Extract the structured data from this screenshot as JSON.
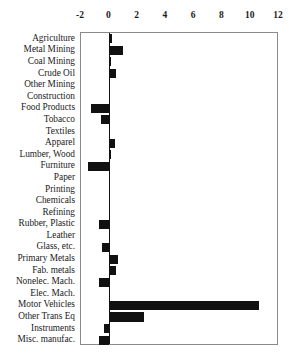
{
  "chart_data": {
    "type": "bar",
    "orientation": "horizontal",
    "title": "",
    "subtitle": "",
    "xlabel": "",
    "ylabel": "",
    "xlim": [
      -2,
      12
    ],
    "xticks": [
      -2,
      0,
      2,
      4,
      6,
      8,
      10,
      12
    ],
    "xticklabels": [
      "-2",
      "0",
      "2",
      "4",
      "6",
      "8",
      "10",
      "12"
    ],
    "grid": false,
    "legend": false,
    "legend_position": "none",
    "bar_color": "#111111",
    "frame_color": "#8a8a8a",
    "categories": [
      "Agriculture",
      "Metal Mining",
      "Coal Mining",
      "Crude Oil",
      "Other Mining",
      "Construction",
      "Food Products",
      "Tobacco",
      "Textiles",
      "Apparel",
      "Lumber, Wood",
      "Furniture",
      "Paper",
      "Printing",
      "Chemicals",
      "Refining",
      "Rubber, Plastic",
      "Leather",
      "Glass, etc.",
      "Primary Metals",
      "Fab. metals",
      "Nonelec. Mach.",
      "Elec. Mach.",
      "Motor Vehicles",
      "Other Trans Eq",
      "Instruments",
      "Misc. manufac."
    ],
    "values": [
      0.2,
      1.0,
      0.1,
      0.45,
      0.05,
      0.0,
      -1.3,
      -0.6,
      0.05,
      0.4,
      0.1,
      -1.5,
      0.0,
      0.0,
      0.0,
      0.0,
      -0.75,
      0.0,
      -0.55,
      0.6,
      0.45,
      -0.7,
      0.0,
      10.6,
      2.45,
      -0.4,
      -0.75
    ]
  }
}
